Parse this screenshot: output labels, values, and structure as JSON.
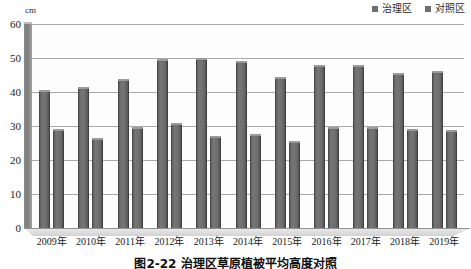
{
  "chart_data": {
    "type": "bar",
    "title": "图2-22  治理区草原植被平均高度对照",
    "xlabel": "",
    "ylabel": "cm",
    "unit": "cm",
    "ylim": [
      0,
      60
    ],
    "yticks": [
      0,
      10,
      20,
      30,
      40,
      50,
      60
    ],
    "grid": true,
    "legend_position": "top-right",
    "categories": [
      "2009年",
      "2010年",
      "2011年",
      "2012年",
      "2013年",
      "2014年",
      "2015年",
      "2016年",
      "2017年",
      "2018年",
      "2019年"
    ],
    "series": [
      {
        "name": "治理区",
        "color": "#6e6e6e",
        "values": [
          40.0,
          41.0,
          43.2,
          49.0,
          49.5,
          48.6,
          43.7,
          47.5,
          47.3,
          45.0,
          45.5
        ]
      },
      {
        "name": "对照区",
        "color": "#6e6e6e",
        "values": [
          28.5,
          26.0,
          29.0,
          30.3,
          26.6,
          27.0,
          25.0,
          29.2,
          29.0,
          28.5,
          28.3
        ]
      }
    ]
  },
  "legend": {
    "items": [
      {
        "label": "治理区",
        "swatch_color": "#6e6e6e"
      },
      {
        "label": "对照区",
        "swatch_color": "#6e6e6e"
      }
    ]
  },
  "axis": {
    "unit_label": "cm",
    "y_labels": [
      "60",
      "50",
      "40",
      "30",
      "20",
      "10",
      "0"
    ],
    "x_labels": [
      "2009年",
      "2010年",
      "2011年",
      "2012年",
      "2013年",
      "2014年",
      "2015年",
      "2016年",
      "2017年",
      "2018年",
      "2019年"
    ]
  },
  "caption": {
    "text": "图2-22  治理区草原植被平均高度对照"
  }
}
